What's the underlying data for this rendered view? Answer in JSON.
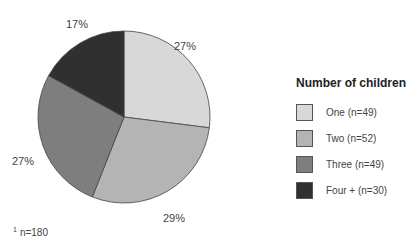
{
  "chart_data": {
    "type": "pie",
    "title": "Number of children",
    "categories": [
      "One (n=49)",
      "Two (n=52)",
      "Three (n=49)",
      "Four + (n=30)"
    ],
    "values": [
      27,
      29,
      27,
      17
    ],
    "counts": [
      49,
      52,
      49,
      30
    ],
    "colors": [
      "#d8d8d8",
      "#b4b4b4",
      "#7e7e7e",
      "#303030"
    ],
    "value_labels": [
      "27%",
      "29%",
      "27%",
      "17%"
    ],
    "legend_position": "right",
    "footnote": "n=180"
  },
  "legend": {
    "title": "Number of children",
    "items": [
      {
        "label": "One (n=49)",
        "color": "#d8d8d8"
      },
      {
        "label": "Two (n=52)",
        "color": "#b4b4b4"
      },
      {
        "label": "Three (n=49)",
        "color": "#7e7e7e"
      },
      {
        "label": "Four + (n=30)",
        "color": "#303030"
      }
    ]
  },
  "labels": {
    "one": "27%",
    "two": "29%",
    "three": "27%",
    "four": "17%"
  },
  "footnote": {
    "marker": "1",
    "text": "n=180"
  }
}
